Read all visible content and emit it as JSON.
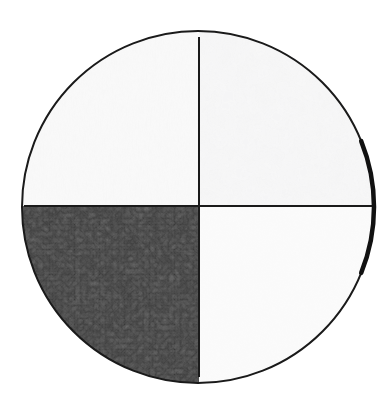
{
  "figure": {
    "title": "Circular four-quadrant sample field",
    "background_color": "#ffffff",
    "canvas": {
      "width": 377,
      "height": 412
    },
    "scanline": {
      "name": "background-horizontal-line",
      "y": 59,
      "color": "#ededed",
      "thickness": 1
    },
    "circle": {
      "center_x": 198,
      "center_y": 207,
      "radius": 176,
      "outline_color": "#1a1a1a",
      "outline_width": 2
    },
    "dividers": {
      "vertical_x": 199,
      "horizontal_y": 206,
      "color": "#1a1a1a",
      "width": 2
    },
    "edge_highlight": {
      "name": "right-edge-thickened-arc",
      "description": "darker thicker arc segment on right rim near the horizontal diameter",
      "color": "#111111",
      "angle_start_deg": -22,
      "angle_end_deg": 22
    }
  },
  "quadrants": [
    {
      "id": "top-left",
      "label": "Quadrant I",
      "position": "upper-left",
      "fill_color": "#f2f2f2",
      "texture": "smooth-horizontal-streaks",
      "mean_gray": 242,
      "relative_brightness": "light"
    },
    {
      "id": "top-right",
      "label": "Quadrant II",
      "position": "upper-right",
      "fill_color": "#f1f1f1",
      "texture": "cloudy-mottled",
      "mean_gray": 240,
      "relative_brightness": "light-mottled"
    },
    {
      "id": "bottom-left",
      "label": "Quadrant III",
      "position": "lower-left",
      "fill_color": "#262626",
      "texture": "dark-cellular-granular",
      "mean_gray": 38,
      "relative_brightness": "dark"
    },
    {
      "id": "bottom-right",
      "label": "Quadrant IV",
      "position": "lower-right",
      "fill_color": "#fbfbfb",
      "texture": "near-uniform-faint-grain",
      "mean_gray": 251,
      "relative_brightness": "brightest"
    }
  ],
  "chart_data": {
    "type": "pie",
    "title": "Circular four-quadrant sample field",
    "categories": [
      "Quadrant I",
      "Quadrant II",
      "Quadrant III",
      "Quadrant IV"
    ],
    "values": [
      25,
      25,
      25,
      25
    ],
    "colors": [
      "#f2f2f2",
      "#f1f1f1",
      "#262626",
      "#fbfbfb"
    ],
    "legend": "none",
    "grid": false,
    "xlabel": "",
    "ylabel": ""
  }
}
